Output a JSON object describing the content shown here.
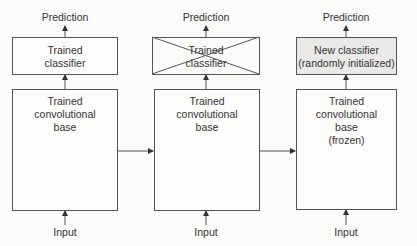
{
  "diagram": {
    "columns": [
      {
        "output_label": "Prediction",
        "classifier": {
          "line1": "Trained",
          "line2": "classifier",
          "crossed_out": false
        },
        "base": {
          "line1": "Trained",
          "line2": "convolutional",
          "line3": "base",
          "line4": ""
        },
        "input_label": "Input"
      },
      {
        "output_label": "Prediction",
        "classifier": {
          "line1": "Trained",
          "line2": "classifier",
          "crossed_out": true
        },
        "base": {
          "line1": "Trained",
          "line2": "convolutional",
          "line3": "base",
          "line4": ""
        },
        "input_label": "Input"
      },
      {
        "output_label": "Prediction",
        "classifier": {
          "line1": "New classifier",
          "line2": "(randomly initialized)",
          "crossed_out": false
        },
        "base": {
          "line1": "Trained",
          "line2": "convolutional",
          "line3": "base",
          "line4": "(frozen)"
        },
        "input_label": "Input"
      }
    ],
    "colors": {
      "stroke": "#555555",
      "new_classifier_fill": "#e9e9e7",
      "background": "#fbfbf9"
    }
  }
}
